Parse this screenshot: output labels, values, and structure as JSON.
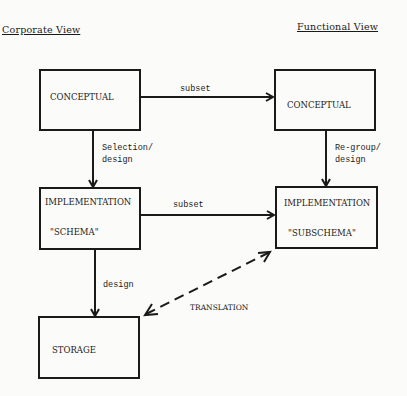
{
  "headings": {
    "left": "Corporate View",
    "right": "Functional View"
  },
  "boxes": {
    "corporate_conceptual": {
      "label": "CONCEPTUAL"
    },
    "functional_conceptual": {
      "label": "CONCEPTUAL"
    },
    "schema": {
      "line1": "IMPLEMENTATION",
      "line2": "\"SCHEMA\""
    },
    "subschema": {
      "line1": "IMPLEMENTATION",
      "line2": "\"SUBSCHEMA\""
    },
    "storage": {
      "label": "STORAGE"
    }
  },
  "edges": {
    "top_subset": "subset",
    "middle_subset": "subset",
    "selection_design_1": "Selection/",
    "selection_design_2": "design",
    "regroup_design_1": "Re-group/",
    "regroup_design_2": "design",
    "storage_design": "design",
    "translation": "TRANSLATION"
  }
}
